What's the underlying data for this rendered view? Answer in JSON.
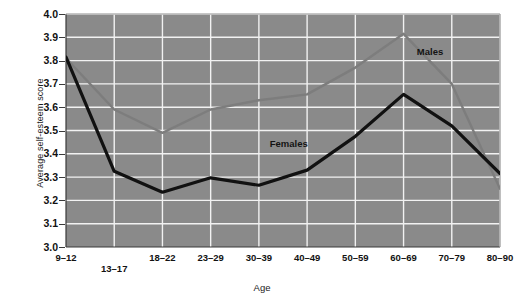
{
  "chart_data": {
    "type": "line",
    "title": "",
    "xlabel": "Age",
    "ylabel": "Average self-esteem score",
    "categories": [
      "9–12",
      "13–17",
      "18–22",
      "23–29",
      "30–39",
      "40–49",
      "50–59",
      "60–69",
      "70–79",
      "80–90"
    ],
    "ylim": [
      3.0,
      4.0
    ],
    "ytick_labels": [
      "3.0",
      "3.1",
      "3.2",
      "3.3",
      "3.4",
      "3.5",
      "3.6",
      "3.7",
      "3.8",
      "3.9",
      "4.0"
    ],
    "ytick_values": [
      3.0,
      3.1,
      3.2,
      3.3,
      3.4,
      3.5,
      3.6,
      3.7,
      3.8,
      3.9,
      4.0
    ],
    "grid": true,
    "legend_position": "inline-annotations",
    "plot_background": "#8a8a8a",
    "grid_color": "#f2f2f2",
    "series": [
      {
        "name": "Males",
        "color": "#7d7d7d",
        "values": [
          3.81,
          3.59,
          3.49,
          3.59,
          3.63,
          3.655,
          3.77,
          3.915,
          3.7,
          3.25
        ],
        "annotation": {
          "text": "Males",
          "category_index": 7.55,
          "value": 3.835
        }
      },
      {
        "name": "Females",
        "color": "#111111",
        "values": [
          3.815,
          3.325,
          3.235,
          3.297,
          3.265,
          3.33,
          3.475,
          3.655,
          3.52,
          3.315
        ],
        "annotation": {
          "text": "Females",
          "category_index": 4.62,
          "value": 3.44
        }
      }
    ]
  }
}
